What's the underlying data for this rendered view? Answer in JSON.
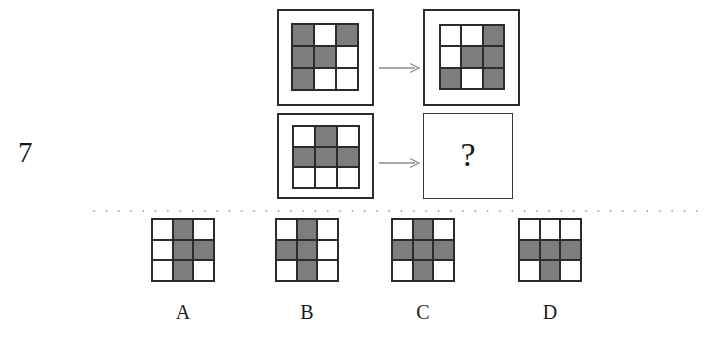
{
  "puzzle": {
    "question_number": "7",
    "question_mark": "?",
    "colors": {
      "filled_cell": "#7d7d7d",
      "empty_cell": "#ffffff",
      "grid_line": "#2b2b2b",
      "panel_border": "#2b2b2b",
      "arrow": "#8c8c8c",
      "separator_dots": "#9a9a9a",
      "text": "#1a1a1a"
    },
    "legend": {
      "filled": 1,
      "empty": 0,
      "note": "3x3 grids; 1 = gray filled cell, 0 = white empty cell"
    },
    "stem": {
      "rows": [
        {
          "name": "row-1",
          "left_grid": [
            [
              1,
              0,
              1
            ],
            [
              1,
              1,
              0
            ],
            [
              1,
              0,
              0
            ]
          ],
          "arrow": "arrow-right-icon",
          "right_grid": [
            [
              0,
              0,
              1
            ],
            [
              0,
              1,
              1
            ],
            [
              1,
              0,
              1
            ]
          ]
        },
        {
          "name": "row-2",
          "left_grid": [
            [
              0,
              1,
              0
            ],
            [
              1,
              1,
              1
            ],
            [
              0,
              0,
              0
            ]
          ],
          "arrow": "arrow-right-icon",
          "right_grid": null,
          "right_is_unknown": true
        }
      ]
    },
    "options": [
      {
        "label": "A",
        "grid": [
          [
            0,
            1,
            0
          ],
          [
            0,
            1,
            1
          ],
          [
            0,
            1,
            0
          ]
        ]
      },
      {
        "label": "B",
        "grid": [
          [
            0,
            1,
            0
          ],
          [
            1,
            1,
            0
          ],
          [
            0,
            1,
            0
          ]
        ]
      },
      {
        "label": "C",
        "grid": [
          [
            0,
            1,
            0
          ],
          [
            1,
            1,
            1
          ],
          [
            0,
            1,
            0
          ]
        ]
      },
      {
        "label": "D",
        "grid": [
          [
            0,
            0,
            0
          ],
          [
            1,
            1,
            1
          ],
          [
            0,
            1,
            0
          ]
        ]
      }
    ]
  }
}
